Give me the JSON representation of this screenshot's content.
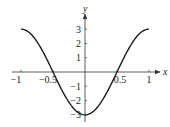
{
  "chart_data": {
    "type": "line",
    "title": "",
    "xlabel": "x",
    "ylabel": "y",
    "xlim": [
      -1,
      1
    ],
    "ylim": [
      -3,
      3
    ],
    "grid": false,
    "series": [
      {
        "name": "y = -3cos(πx)",
        "x": [
          -1,
          -0.75,
          -0.5,
          -0.25,
          0,
          0.25,
          0.5,
          0.75,
          1
        ],
        "values": [
          3,
          2.12,
          0,
          -2.12,
          -3,
          -2.12,
          0,
          2.12,
          3
        ]
      }
    ],
    "x_ticks": [
      {
        "value": -1,
        "label": "−1"
      },
      {
        "value": -0.5,
        "label": "−0.5"
      },
      {
        "value": 0.5,
        "label": "0.5"
      },
      {
        "value": 1,
        "label": "1"
      }
    ],
    "y_ticks": [
      {
        "value": 3,
        "label": "3"
      },
      {
        "value": 2,
        "label": "2"
      },
      {
        "value": 1,
        "label": "1"
      },
      {
        "value": -1,
        "label": "−1"
      },
      {
        "value": -2,
        "label": "−2"
      },
      {
        "value": -3,
        "label": "−3"
      }
    ]
  },
  "colors": {
    "curve": "#1a1a1a",
    "axis": "#333333"
  }
}
